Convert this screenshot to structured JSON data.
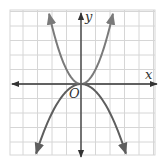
{
  "chart_data": {
    "type": "line",
    "title": "",
    "xlabel": "x",
    "ylabel": "y",
    "origin_label": "O",
    "xlim": [
      -5,
      5
    ],
    "ylim": [
      -5,
      5
    ],
    "grid": true,
    "grid_step": 1,
    "axes_arrows": true,
    "series": [
      {
        "name": "upward parabola",
        "equation": "y = x^2",
        "a": 1.0,
        "x_range": [
          -2.2,
          2.2
        ],
        "color": "#7a7a7a"
      },
      {
        "name": "downward parabola",
        "equation": "y = -0.5x^2",
        "a": -0.5,
        "x_range": [
          -3.1,
          3.1
        ],
        "color": "#5e5e5e"
      }
    ]
  },
  "colors": {
    "grid": "#d6d6d6",
    "axis": "#333333",
    "background": "#ffffff"
  }
}
